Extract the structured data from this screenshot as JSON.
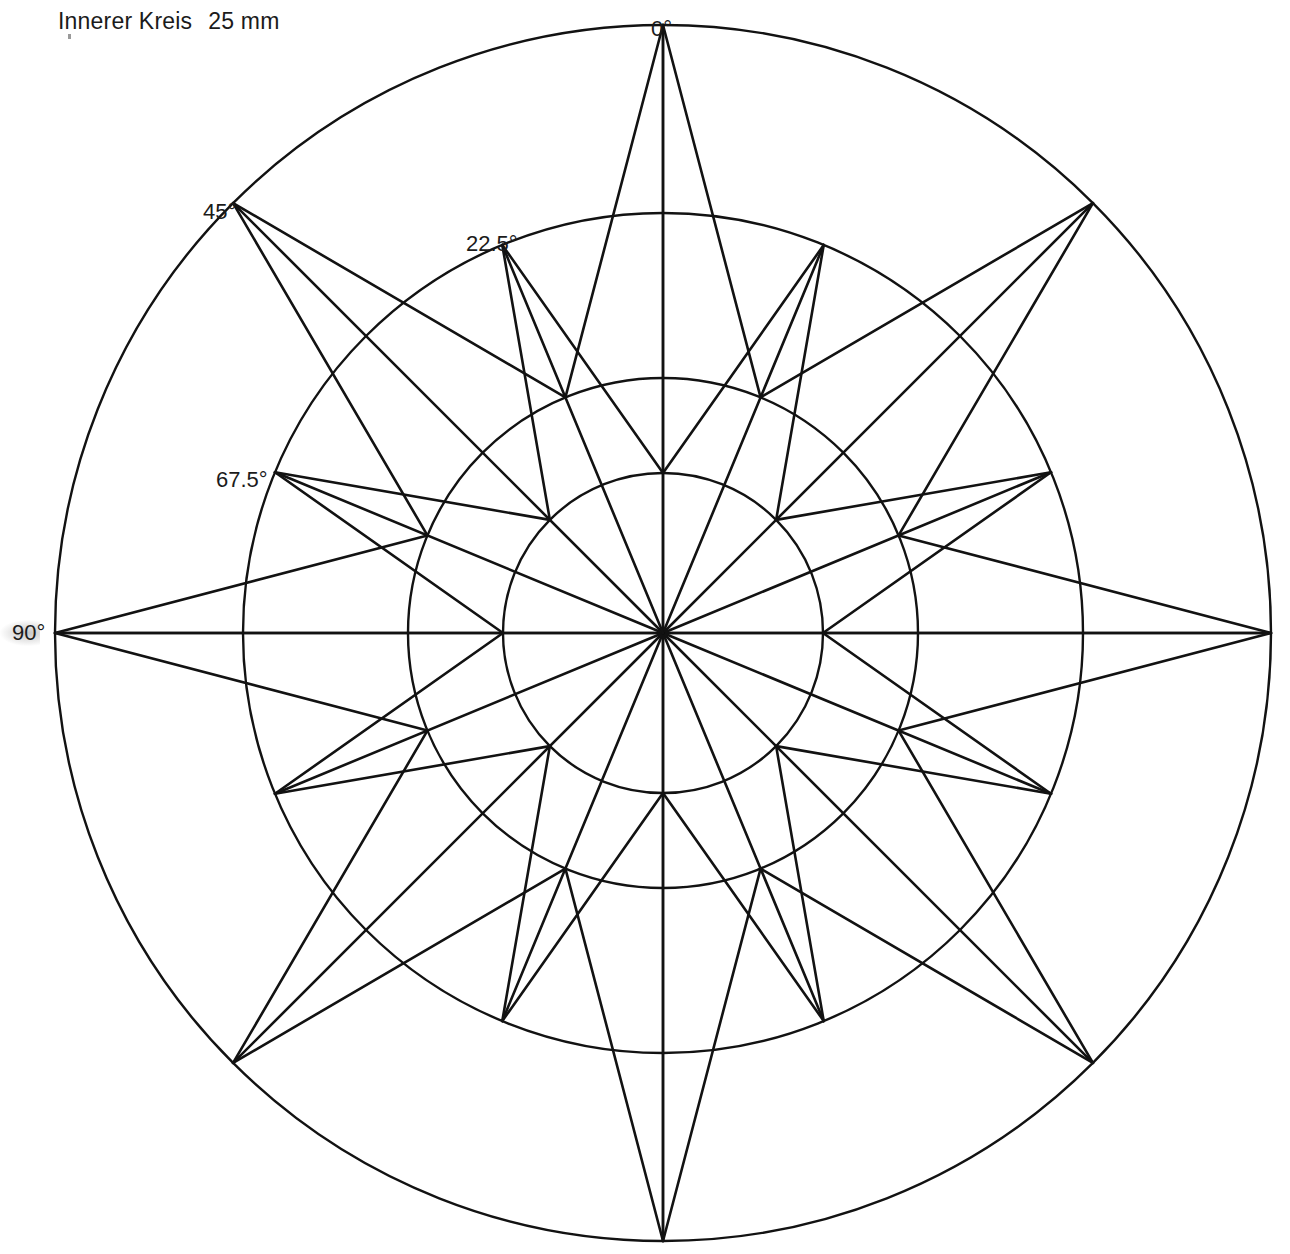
{
  "caption": {
    "label": "Innerer Kreis",
    "value": "25 mm"
  },
  "colors": {
    "stroke": "#121212",
    "background": "#ffffff",
    "text": "#1b1b1b"
  },
  "axis_labels": [
    {
      "text": "0°",
      "x": 651,
      "y": 16,
      "angle_deg": 0
    },
    {
      "text": "22.5°",
      "x": 466,
      "y": 231,
      "angle_deg": 22.5
    },
    {
      "text": "45°",
      "x": 203,
      "y": 199,
      "angle_deg": 45
    },
    {
      "text": "67.5°",
      "x": 216,
      "y": 467,
      "angle_deg": 67.5
    },
    {
      "text": "90°",
      "x": 12,
      "y": 620,
      "angle_deg": 90
    }
  ],
  "chart_data": {
    "type": "polar-compass-rose",
    "center": {
      "x": 663,
      "y": 633
    },
    "grid": true,
    "circles": [
      {
        "name": "innerer-kreis",
        "radius": 160,
        "label": "25 mm"
      },
      {
        "name": "zweiter-kreis",
        "radius": 255
      },
      {
        "name": "dritter-kreis",
        "radius": 420
      },
      {
        "name": "aeusserer-kreis",
        "radius": 608
      }
    ],
    "spoke_count": 16,
    "spoke_step_deg": 22.5,
    "tick_angles_deg": [
      0,
      22.5,
      45,
      67.5,
      90,
      112.5,
      135,
      157.5,
      180,
      202.5,
      225,
      247.5,
      270,
      292.5,
      315,
      337.5
    ],
    "points": [
      {
        "angle_deg": 0,
        "tip_radius": 608,
        "flank_radius": 255,
        "order": "major"
      },
      {
        "angle_deg": 22.5,
        "tip_radius": 420,
        "flank_radius": 160,
        "order": "minor"
      },
      {
        "angle_deg": 45,
        "tip_radius": 608,
        "flank_radius": 255,
        "order": "major"
      },
      {
        "angle_deg": 67.5,
        "tip_radius": 420,
        "flank_radius": 160,
        "order": "minor"
      },
      {
        "angle_deg": 90,
        "tip_radius": 608,
        "flank_radius": 255,
        "order": "major"
      },
      {
        "angle_deg": 112.5,
        "tip_radius": 420,
        "flank_radius": 160,
        "order": "minor"
      },
      {
        "angle_deg": 135,
        "tip_radius": 608,
        "flank_radius": 255,
        "order": "major"
      },
      {
        "angle_deg": 157.5,
        "tip_radius": 420,
        "flank_radius": 160,
        "order": "minor"
      },
      {
        "angle_deg": 180,
        "tip_radius": 608,
        "flank_radius": 255,
        "order": "major"
      },
      {
        "angle_deg": 202.5,
        "tip_radius": 420,
        "flank_radius": 160,
        "order": "minor"
      },
      {
        "angle_deg": 225,
        "tip_radius": 608,
        "flank_radius": 255,
        "order": "major"
      },
      {
        "angle_deg": 247.5,
        "tip_radius": 420,
        "flank_radius": 160,
        "order": "minor"
      },
      {
        "angle_deg": 270,
        "tip_radius": 608,
        "flank_radius": 255,
        "order": "major"
      },
      {
        "angle_deg": 292.5,
        "tip_radius": 420,
        "flank_radius": 160,
        "order": "minor"
      },
      {
        "angle_deg": 315,
        "tip_radius": 608,
        "flank_radius": 255,
        "order": "major"
      },
      {
        "angle_deg": 337.5,
        "tip_radius": 420,
        "flank_radius": 160,
        "order": "minor"
      }
    ],
    "xlabel": "",
    "ylabel": "",
    "legend": []
  }
}
